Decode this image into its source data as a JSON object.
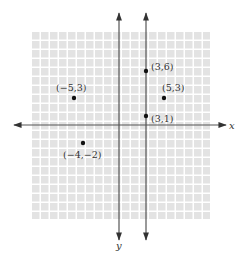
{
  "chart_data": {
    "type": "scatter",
    "title": "",
    "xlabel": "x",
    "ylabel": "y",
    "xlim": [
      -10,
      10
    ],
    "ylim": [
      -10,
      10
    ],
    "grid": true,
    "points": [
      {
        "x": -5,
        "y": 3,
        "label": "(−5,3)"
      },
      {
        "x": 3,
        "y": 6,
        "label": "(3,6)"
      },
      {
        "x": 5,
        "y": 3,
        "label": "(5,3)"
      },
      {
        "x": 3,
        "y": 1,
        "label": "(3,1)"
      },
      {
        "x": -4,
        "y": -2,
        "label": "(−4,−2)"
      }
    ],
    "annotations": [
      {
        "type": "vertical-line",
        "x": 3,
        "description": "vertical line through (3,6) and (3,1)"
      }
    ]
  },
  "axes": {
    "x_label": "x",
    "y_label": "y"
  },
  "colors": {
    "grid_cell": "#e3e3e3",
    "grid_gap": "#ffffff",
    "axis": "#555555",
    "point": "#111111",
    "label": "#333333"
  }
}
